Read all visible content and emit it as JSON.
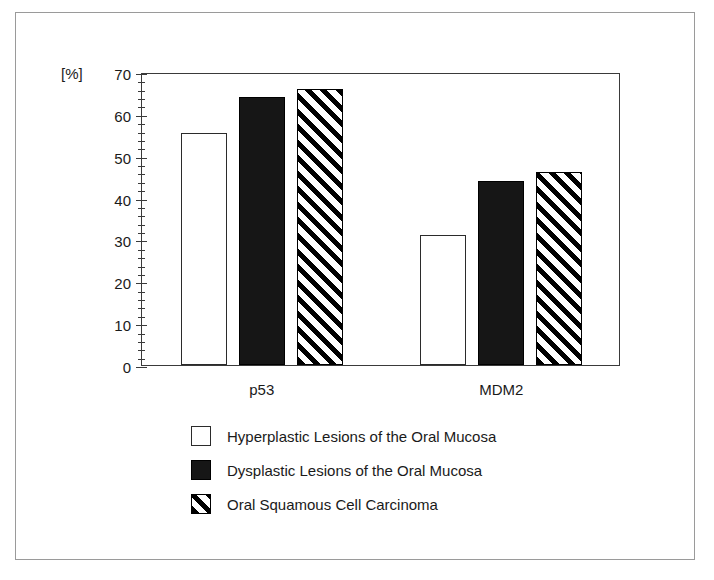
{
  "chart_data": {
    "type": "bar",
    "title": "",
    "xlabel": "",
    "ylabel": "[%]",
    "ylim": [
      0,
      70
    ],
    "ytick_step": 10,
    "yminor_step": 2,
    "grid": false,
    "legend_position": "below",
    "categories": [
      "p53",
      "MDM2"
    ],
    "ytick_labels": [
      "0",
      "10",
      "20",
      "30",
      "40",
      "50",
      "60",
      "70"
    ],
    "series": [
      {
        "name": "Hyperplastic Lesions of the Oral Mucosa",
        "fill": "open",
        "values": [
          55.5,
          31
        ]
      },
      {
        "name": "Dysplastic Lesions of the Oral Mucosa",
        "fill": "solid",
        "values": [
          64,
          44
        ]
      },
      {
        "name": "Oral Squamous Cell Carcinoma",
        "fill": "hatch",
        "values": [
          66,
          46
        ]
      }
    ]
  },
  "colors": {
    "ink": "#1a1a1a",
    "axis": "#3a3a3a",
    "frame": "#9a9a9a",
    "solid_fill": "#161616",
    "open_fill": "#ffffff"
  }
}
